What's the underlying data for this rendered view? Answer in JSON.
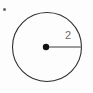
{
  "figure": {
    "type": "geometry-diagram",
    "canvas": {
      "width": 93,
      "height": 93,
      "background": "#fdfdfd"
    },
    "circle": {
      "name": "circle-outline",
      "center_x": 47,
      "center_y": 47,
      "radius": 34.5,
      "stroke_color": "#2e2e2e",
      "stroke_width": 1.1,
      "fill": "none"
    },
    "center_point": {
      "name": "circle-center-point",
      "x": 46,
      "y": 47,
      "radius": 3.2,
      "color": "#111111"
    },
    "radius_segment": {
      "name": "radius-line",
      "x1": 46,
      "y1": 47,
      "x2": 81.5,
      "y2": 47,
      "stroke_color": "#7b7b7b",
      "stroke_width": 1.4
    },
    "radius_label": {
      "name": "radius-measure-label",
      "text": "2",
      "x": 68,
      "y": 36,
      "color": "#6d6d6d",
      "font_size": 11
    },
    "corner_mark": {
      "name": "corner-artifact-dot",
      "x": 4.5,
      "y": 9.5,
      "size": 2.4,
      "color": "#4a4a4a"
    }
  },
  "chart_data": {
    "type": "diagram",
    "title": "",
    "shape": "circle",
    "annotations": [
      {
        "label": "2",
        "measures": "radius",
        "value": 2,
        "units": ""
      }
    ],
    "elements": [
      "circle-outline",
      "circle-center-point",
      "radius-line",
      "radius-measure-label"
    ]
  }
}
